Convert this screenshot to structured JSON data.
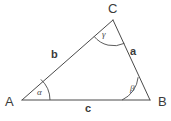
{
  "figure": {
    "type": "triangle-diagram",
    "background_color": "#ffffff",
    "stroke_color": "#4a4a4a",
    "text_color": "#3b3b3b",
    "stroke_width": 1,
    "canvas": {
      "width": 171,
      "height": 121
    }
  },
  "vertices": [
    {
      "id": "A",
      "label": "A",
      "x": 22,
      "y": 100
    },
    {
      "id": "B",
      "label": "B",
      "x": 150,
      "y": 100
    },
    {
      "id": "C",
      "label": "C",
      "x": 113,
      "y": 20
    }
  ],
  "sides": [
    {
      "id": "a",
      "label": "a",
      "from": "B",
      "to": "C"
    },
    {
      "id": "b",
      "label": "b",
      "from": "A",
      "to": "C"
    },
    {
      "id": "c",
      "label": "c",
      "from": "A",
      "to": "B"
    }
  ],
  "angles": [
    {
      "id": "alpha",
      "label": "α",
      "at_vertex": "A",
      "arc_radius": 28
    },
    {
      "id": "beta",
      "label": "β",
      "at_vertex": "B",
      "arc_radius": 28
    },
    {
      "id": "gamma",
      "label": "γ",
      "at_vertex": "C",
      "arc_radius": 25
    }
  ]
}
